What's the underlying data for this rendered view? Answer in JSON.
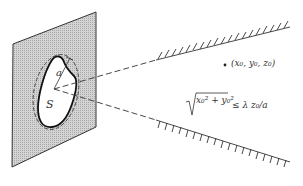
{
  "diagram": {
    "type": "fraunhofer-aperture-geometry",
    "labels": {
      "aperture_radius": "a",
      "aperture_area": "S",
      "observation_point": "(x₀, y₀, z₀)",
      "condition_lhs": "x₀² + y₀²",
      "condition_rhs": "≤ λ z₀/a"
    },
    "colors": {
      "plane_fill": "#c8c8c8",
      "line": "#222222",
      "background": "#ffffff"
    },
    "elements": {
      "aperture_plane": "shaded parallelogram screen",
      "aperture_outline": "solid irregular closed curve",
      "bounding_circle": "dashed circle of radius a",
      "diffraction_cone": "two dashed lines diverging from aperture center",
      "cone_boundaries": "two hatched lines marking far-field region",
      "observation_point_marker": "dot"
    }
  }
}
